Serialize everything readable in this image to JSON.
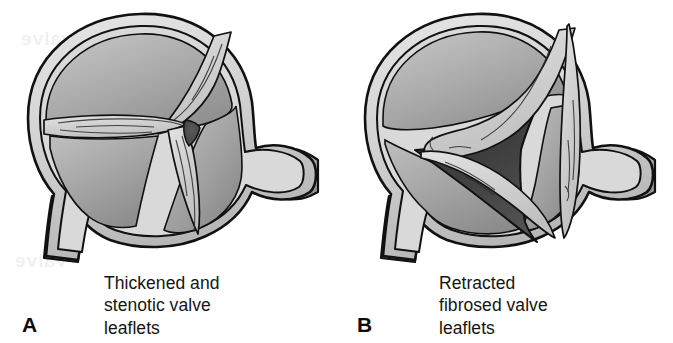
{
  "figure": {
    "background_color": "#ffffff",
    "width": 673,
    "height": 343
  },
  "palette": {
    "outline": "#111111",
    "wall_light": "#d8d8d8",
    "chamber_light": "#b4b4b4",
    "chamber_mid": "#9a9a9a",
    "chamber_dark": "#808080",
    "leaflet_light": "#d2d2d2",
    "leaflet_shade": "#a8a8a8",
    "orifice_dark": "#4a4a4a",
    "orifice_darkest": "#3a3a3a",
    "text_color": "#141414"
  },
  "panels": [
    {
      "id": "a",
      "label": "A",
      "caption_lines": [
        "Thickened and",
        "stenotic valve",
        "leaflets"
      ],
      "caption_full": "Thickened and stenotic valve leaflets",
      "orifice": {
        "name": "stenotic-orifice",
        "size": "pinpoint",
        "shape": "small triangle",
        "fill": "#4e4e4e"
      },
      "leaflets": {
        "count": 3,
        "state": "thickened, fused at commissures, striated fibrous texture"
      },
      "vessels": [
        {
          "name": "right-vessel-stub",
          "position": "right",
          "direction": "lateral"
        },
        {
          "name": "bottom-vessel-stub",
          "position": "bottom-left",
          "direction": "inferior"
        }
      ]
    },
    {
      "id": "b",
      "label": "B",
      "caption_lines": [
        "Retracted",
        "fibrosed valve",
        "leaflets"
      ],
      "caption_full": "Retracted fibrosed valve leaflets",
      "orifice": {
        "name": "regurgitant-orifice",
        "size": "large",
        "shape": "wide triangle",
        "fill": "#3d3d3d"
      },
      "leaflets": {
        "count": 3,
        "state": "retracted, shortened and fibrosed leaving a wide central gap"
      },
      "vessels": [
        {
          "name": "right-vessel-stub",
          "position": "right",
          "direction": "lateral"
        },
        {
          "name": "bottom-vessel-stub",
          "position": "bottom-left",
          "direction": "inferior"
        }
      ]
    }
  ],
  "ghost_text": {
    "note": "Faint show-through of printing on the reverse of the page",
    "lines": [
      "valve",
      "leaflets",
      "peri",
      "devel",
      "opm"
    ]
  }
}
